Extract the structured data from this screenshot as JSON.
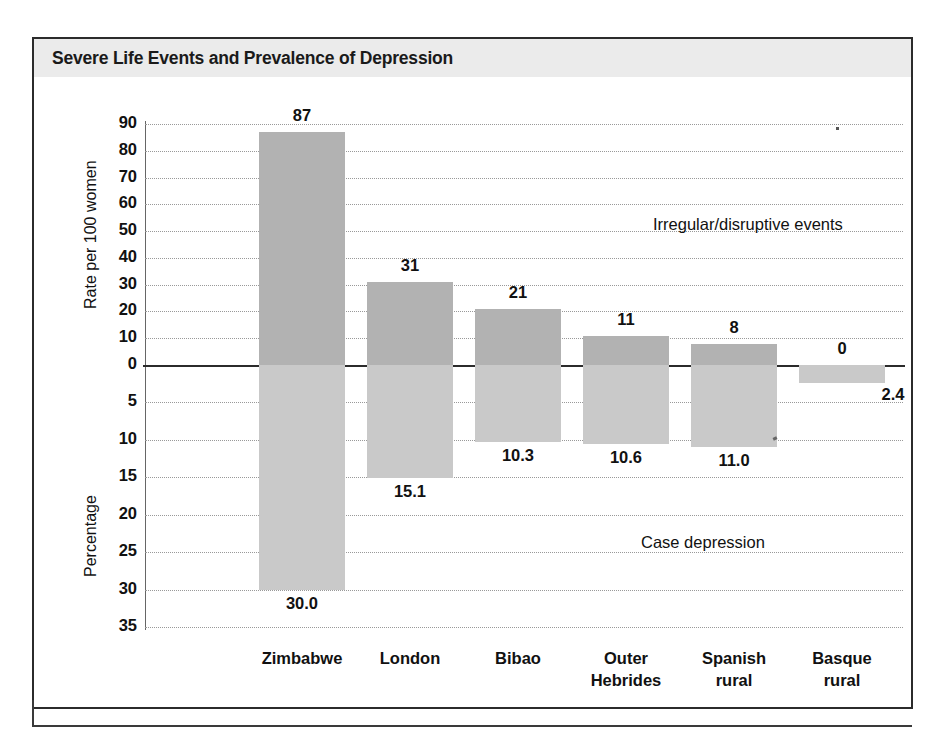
{
  "figure": {
    "title": "Severe Life Events and Prevalence of Depression",
    "title_band_color": "#ebebeb",
    "frame_color": "#2b2b2b"
  },
  "chart_data": {
    "type": "bar",
    "title": "Severe Life Events and Prevalence of Depression",
    "orientation": "vertical",
    "layout": "back-to-back dual-axis (upper bars above zero, lower bars below zero)",
    "grid": true,
    "legend_position": "in-plot annotations",
    "categories": [
      "Zimbabwe",
      "London",
      "Bibao",
      "Outer Hebrides",
      "Spanish rural",
      "Basque rural"
    ],
    "category_lines": [
      [
        "Zimbabwe"
      ],
      [
        "London"
      ],
      [
        "Bibao"
      ],
      [
        "Outer",
        "Hebrides"
      ],
      [
        "Spanish",
        "rural"
      ],
      [
        "Basque",
        "rural"
      ]
    ],
    "series": [
      {
        "name": "Irregular/disruptive events",
        "direction": "up",
        "axis": "upper",
        "ylabel": "Rate per 100 women",
        "ylim": [
          0,
          90
        ],
        "ytick_step": 10,
        "yticks": [
          90,
          80,
          70,
          60,
          50,
          40,
          30,
          20,
          10,
          0
        ],
        "color": "#b2b2b2",
        "values": [
          87,
          31,
          21,
          11,
          8,
          0
        ],
        "value_labels": [
          "87",
          "31",
          "21",
          "11",
          "8",
          "0"
        ]
      },
      {
        "name": "Case depression",
        "direction": "down",
        "axis": "lower",
        "ylabel": "Percentage",
        "ylim": [
          0,
          35
        ],
        "ytick_step": 5,
        "yticks": [
          0,
          5,
          10,
          15,
          20,
          25,
          30,
          35
        ],
        "color": "#c9c9c9",
        "values": [
          30.0,
          15.1,
          10.3,
          10.6,
          11.0,
          2.4
        ],
        "value_labels": [
          "30.0",
          "15.1",
          "10.3",
          "10.6",
          "11.0",
          "2.4"
        ]
      }
    ],
    "annotations": [
      {
        "text": "Irregular/disruptive events",
        "region": "upper"
      },
      {
        "text": "Case depression",
        "region": "lower"
      }
    ],
    "axis_titles": {
      "upper": "Rate per 100 women",
      "lower": "Percentage"
    },
    "xlabel": ""
  }
}
